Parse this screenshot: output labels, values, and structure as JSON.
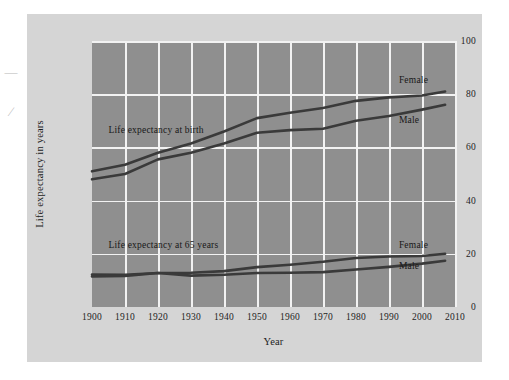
{
  "figure": {
    "margin_marks": [
      "—",
      "∕"
    ]
  },
  "chart_data": {
    "type": "line",
    "title": "",
    "xlabel": "Year",
    "ylabel": "Life expectancy in years",
    "xlim": [
      1900,
      2010
    ],
    "ylim": [
      0,
      100
    ],
    "xticks": [
      "1900",
      "1910",
      "1920",
      "1930",
      "1940",
      "1950",
      "1960",
      "1970",
      "1980",
      "1990",
      "2000",
      "2010"
    ],
    "yticks": [
      "0",
      "20",
      "40",
      "60",
      "80",
      "100"
    ],
    "grid": true,
    "legend_position": "inline-right",
    "plot_background": "#8f8f8f",
    "grid_color": "#f2f2f2",
    "line_color": "#3a3a3a",
    "annotations": [
      {
        "text": "Life expectancy at birth",
        "x": 1905,
        "y": 66
      },
      {
        "text": "Life expectancy at 65 years",
        "x": 1905,
        "y": 23
      }
    ],
    "x": [
      1900,
      1910,
      1920,
      1930,
      1940,
      1950,
      1960,
      1970,
      1980,
      1990,
      2000,
      2007
    ],
    "series": [
      {
        "name": "Female",
        "group": "Life expectancy at birth",
        "label": "Female",
        "label_x": 1993,
        "label_y": 85,
        "values": [
          51.0,
          53.5,
          58.0,
          61.5,
          66.0,
          71.0,
          73.0,
          74.8,
          77.5,
          78.8,
          79.5,
          81.0
        ]
      },
      {
        "name": "Male",
        "group": "Life expectancy at birth",
        "label": "Male",
        "label_x": 1993,
        "label_y": 70,
        "values": [
          48.0,
          50.0,
          55.5,
          58.0,
          61.5,
          65.5,
          66.5,
          67.0,
          70.0,
          71.8,
          74.2,
          76.0
        ]
      },
      {
        "name": "Female",
        "group": "Life expectancy at 65 years",
        "label": "Female",
        "label_x": 1993,
        "label_y": 23,
        "values": [
          12.2,
          12.1,
          12.8,
          12.9,
          13.5,
          15.0,
          15.9,
          17.0,
          18.4,
          19.0,
          19.2,
          20.0
        ]
      },
      {
        "name": "Male",
        "group": "Life expectancy at 65 years",
        "label": "Male",
        "label_x": 1993,
        "label_y": 15,
        "values": [
          11.5,
          11.7,
          12.8,
          11.8,
          12.1,
          12.8,
          12.9,
          13.1,
          14.1,
          15.1,
          16.3,
          17.4
        ]
      }
    ]
  }
}
